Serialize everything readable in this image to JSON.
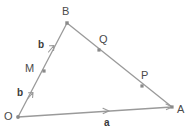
{
  "figure": {
    "background_color": "#ffffff",
    "line_color": "#9a9a9a",
    "point_color": "#8a8a8a",
    "label_color": "#4a4a4a",
    "vector_label_color": "#3a3a3a",
    "width": 195,
    "height": 128
  },
  "vertices": [
    {
      "id": "O",
      "label": "O",
      "x": 18,
      "y": 117,
      "label_x": 4,
      "label_y": 111,
      "marker": "circle"
    },
    {
      "id": "B",
      "label": "B",
      "x": 67,
      "y": 23,
      "label_x": 62,
      "label_y": 6,
      "marker": "square"
    },
    {
      "id": "A",
      "label": "A",
      "x": 172,
      "y": 107,
      "label_x": 177,
      "label_y": 104,
      "marker": "square"
    }
  ],
  "edge_points": [
    {
      "id": "M",
      "label": "M",
      "x": 44,
      "y": 71,
      "label_x": 25,
      "label_y": 63,
      "on_edge": "OB"
    },
    {
      "id": "Q",
      "label": "Q",
      "x": 99,
      "y": 50,
      "label_x": 99,
      "label_y": 34,
      "on_edge": "BA"
    },
    {
      "id": "P",
      "label": "P",
      "x": 142,
      "y": 86,
      "label_x": 141,
      "label_y": 70,
      "on_edge": "BA"
    }
  ],
  "edges": [
    {
      "id": "OB",
      "from": "O",
      "to": "B",
      "x1": 18,
      "y1": 117,
      "x2": 67,
      "y2": 23
    },
    {
      "id": "BA",
      "from": "B",
      "to": "A",
      "x1": 67,
      "y1": 23,
      "x2": 172,
      "y2": 107
    },
    {
      "id": "OA",
      "from": "O",
      "to": "A",
      "x1": 18,
      "y1": 117,
      "x2": 172,
      "y2": 107
    }
  ],
  "vector_labels": [
    {
      "id": "b-upper",
      "label": "b",
      "x": 38,
      "y": 40,
      "arrow_x": 54,
      "arrow_y": 46,
      "arrow_angle": -62.5,
      "on_edge": "OB"
    },
    {
      "id": "b-lower",
      "label": "b",
      "x": 17,
      "y": 88,
      "arrow_x": 33,
      "arrow_y": 93,
      "arrow_angle": -62.5,
      "on_edge": "OB"
    },
    {
      "id": "a-base",
      "label": "a",
      "x": 104,
      "y": 118,
      "arrow_x": 108,
      "arrow_y": 111,
      "arrow_angle": -3.7,
      "on_edge": "OA"
    }
  ]
}
